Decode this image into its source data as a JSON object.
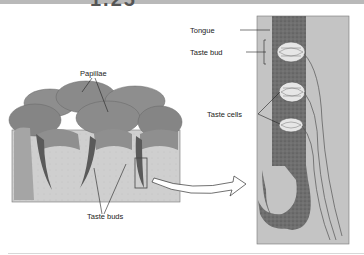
{
  "figure": {
    "number_partial": "1.25"
  },
  "labels": {
    "papillae": "Papillae",
    "taste_buds": "Taste buds",
    "tongue": "Tongue",
    "taste_bud": "Taste bud",
    "taste_cells": "Taste cells"
  },
  "colors": {
    "papillae_fill": "#8a8a8a",
    "tissue_fill": "#c9c9c9",
    "tongue_section": "#6a6a6a",
    "background_panel": "#bdbdbd"
  }
}
